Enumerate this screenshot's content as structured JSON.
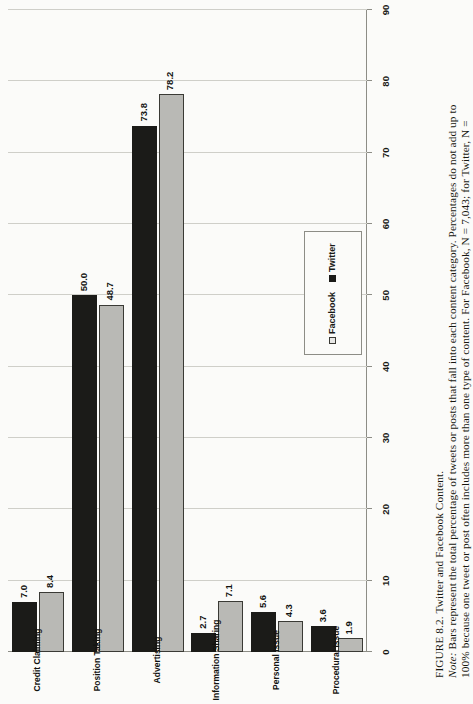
{
  "figure": {
    "number_label": "FIGURE 8.2.",
    "title": "Twitter and Facebook Content.",
    "note_label": "Note:",
    "note_line_1": "Bars represent the total percentage of tweets or posts that fall into each content category. Percentages do not add up to",
    "note_line_2": "100% because one tweet or post often includes more than one type of content. For Facebook, N = 7,043; for Twitter, N ="
  },
  "legend": {
    "position": "top-left",
    "items": [
      {
        "label": "Facebook",
        "color": "#b9b9b5",
        "swatch": "square-outline-icon"
      },
      {
        "label": "Twitter",
        "color": "#1b1b18",
        "swatch": "square-filled-icon"
      }
    ]
  },
  "chart_data": {
    "type": "bar",
    "orientation": "horizontal-rotated",
    "title": "Twitter and Facebook Content",
    "xlabel": "",
    "ylabel": "",
    "ylim": [
      0,
      90
    ],
    "yticks": [
      0,
      10,
      20,
      30,
      40,
      50,
      60,
      70,
      80,
      90
    ],
    "grid": true,
    "categories": [
      "Credit Claiming",
      "Position Taking",
      "Advertising",
      "Information Sharing",
      "Personal Issue",
      "Procedural Issue"
    ],
    "series": [
      {
        "name": "Facebook",
        "color": "#b9b9b5",
        "values": [
          8.4,
          48.7,
          78.2,
          7.1,
          4.3,
          1.9
        ],
        "labels": [
          "8.4",
          "48.7",
          "78.2",
          "7.1",
          "4.3",
          "1.9"
        ]
      },
      {
        "name": "Twitter",
        "color": "#1b1b18",
        "values": [
          7.0,
          50.0,
          73.8,
          2.7,
          5.6,
          3.6
        ],
        "labels": [
          "7.0",
          "50.0",
          "73.8",
          "2.7",
          "5.6",
          "3.6"
        ]
      }
    ]
  }
}
